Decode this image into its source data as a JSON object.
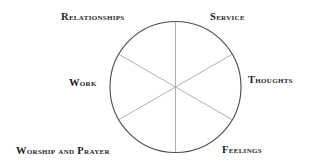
{
  "diagram": {
    "type": "wheel",
    "center": {
      "x": 175.5,
      "y": 87
    },
    "radius": 65.5,
    "spoke_angles_deg": [
      90,
      30,
      -30,
      -90,
      -150,
      150
    ],
    "colors": {
      "circle": "#4a4a4a",
      "spokes": "#b0b0b0",
      "text": "#1e1e1e"
    },
    "labels": [
      {
        "id": "relationships",
        "text": "Relationships"
      },
      {
        "id": "service",
        "text": "Service"
      },
      {
        "id": "thoughts",
        "text": "Thoughts"
      },
      {
        "id": "feelings",
        "text": "Feelings"
      },
      {
        "id": "worship",
        "text": "Worship and Prayer"
      },
      {
        "id": "work",
        "text": "Work"
      }
    ]
  }
}
